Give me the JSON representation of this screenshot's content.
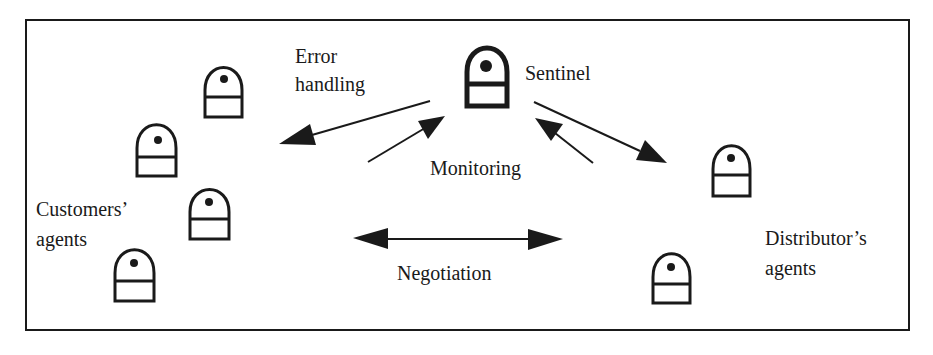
{
  "frame": {
    "x": 26,
    "y": 20,
    "width": 883,
    "height": 310,
    "stroke": "#1a1a1a"
  },
  "labels": {
    "error_handling": [
      "Error",
      "handling"
    ],
    "sentinel": "Sentinel",
    "monitoring": "Monitoring",
    "customers_agents": [
      "Customers’",
      "agents"
    ],
    "negotiation": "Negotiation",
    "distributors_agents": [
      "Distributor’s",
      "agents"
    ]
  },
  "agents": {
    "sentinel": {
      "x": 465,
      "y": 49,
      "w": 44,
      "h": 59,
      "icon": "sentinel-agent-icon",
      "bold": true
    },
    "customers": [
      {
        "x": 204,
        "y": 68,
        "w": 39,
        "h": 50,
        "icon": "agent-icon"
      },
      {
        "x": 136,
        "y": 126,
        "w": 41,
        "h": 51,
        "icon": "agent-icon"
      },
      {
        "x": 189,
        "y": 190,
        "w": 41,
        "h": 50,
        "icon": "agent-icon"
      },
      {
        "x": 114,
        "y": 250,
        "w": 41,
        "h": 52,
        "icon": "agent-icon"
      }
    ],
    "distributors": [
      {
        "x": 712,
        "y": 146,
        "w": 39,
        "h": 51,
        "icon": "agent-icon"
      },
      {
        "x": 652,
        "y": 254,
        "w": 39,
        "h": 50,
        "icon": "agent-icon"
      }
    ]
  },
  "arrows": [
    {
      "name": "error-handling-arrow",
      "from": [
        430,
        101
      ],
      "to": [
        279,
        144
      ],
      "heads": "end"
    },
    {
      "name": "monitoring-left-arrow",
      "from": [
        368,
        162
      ],
      "to": [
        445,
        116
      ],
      "heads": "end"
    },
    {
      "name": "sentinel-to-distributor-arrow",
      "from": [
        534,
        102
      ],
      "to": [
        667,
        163
      ],
      "heads": "end"
    },
    {
      "name": "monitoring-right-arrow",
      "from": [
        593,
        163
      ],
      "to": [
        535,
        118
      ],
      "heads": "end"
    },
    {
      "name": "negotiation-arrow",
      "from": [
        353,
        239
      ],
      "to": [
        563,
        239
      ],
      "heads": "both"
    }
  ],
  "colors": {
    "ink": "#1a1a1a",
    "background": "#ffffff"
  }
}
